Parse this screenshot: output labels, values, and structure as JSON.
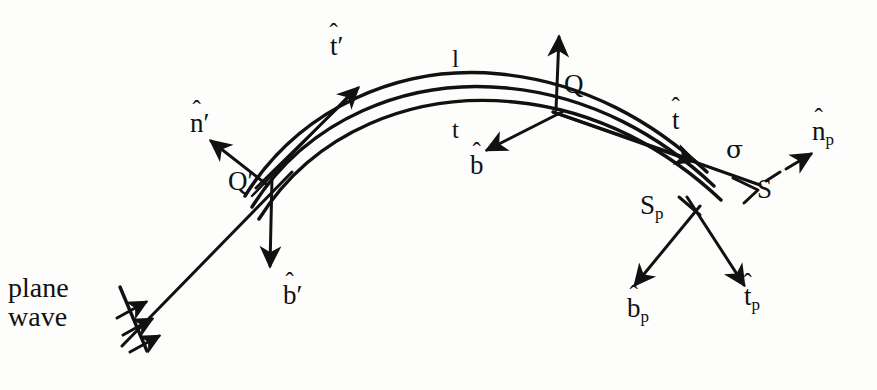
{
  "figure": {
    "kind": "ray-geometry-diagram",
    "title_text": "",
    "background_color": "#fdfdfc",
    "ink_color": "#111111"
  },
  "labels": {
    "plane_wave_line1": "plane",
    "plane_wave_line2": "wave",
    "n_prime": "n",
    "n_prime_prime_mark": "′",
    "t_prime": "t",
    "t_prime_prime_mark": "′",
    "b_prime": "b",
    "b_prime_prime_mark": "′",
    "q_prime": "Q",
    "q_prime_mark": "′",
    "q": "Q",
    "l": "l",
    "t_lower": "t",
    "b_hat": "b",
    "t_hat": "t",
    "sigma": "σ",
    "s_point": "S",
    "s_p_point": "S",
    "s_p_sub": "p",
    "n_p": "n",
    "n_p_sub": "p",
    "b_p": "b",
    "b_p_sub": "p",
    "t_p": "t",
    "t_p_sub": "p",
    "hat": "ˆ"
  },
  "elements": {
    "curved_edge": "three-parallel-curved-lines-arc",
    "incident_ray": "straight-line-from-lower-left-to-Q-prime",
    "diffracted_ray": "straight-line-from-Q-to-lower-right",
    "wavefront_tick": "short-line-segment",
    "plane_wave_arrows_count": 3,
    "dashed_arrow": "n_p"
  },
  "colors": {
    "stroke": "#111111",
    "background": "#fdfdfc"
  }
}
